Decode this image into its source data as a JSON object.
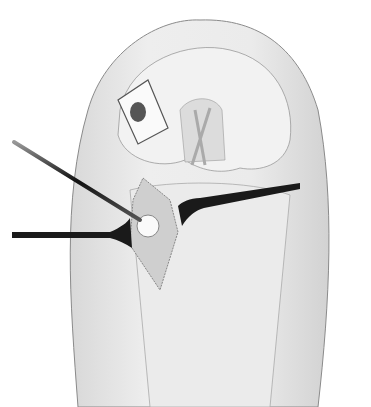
{
  "image": {
    "subject": "surgical illustration of knee with arthrotomy and retractors",
    "colors": {
      "background": "#ffffff",
      "skin": "#ececec",
      "skin_shade": "#d6d6d6",
      "outline": "#8a8a8a",
      "instrument": "#2a2a2a",
      "cavity": "#cfcfcf"
    }
  }
}
